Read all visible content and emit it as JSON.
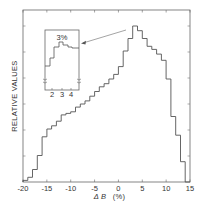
{
  "chart_data": {
    "type": "bar",
    "subtype": "step-histogram",
    "title": "",
    "xlabel": "Δ B    (%)",
    "xlabel_symbol": "Δ B",
    "xlabel_unit": "(%)",
    "ylabel": "RELATIVE VALUES",
    "xlim": [
      -20,
      15
    ],
    "ylim": [
      0,
      1.1
    ],
    "x_ticks": [
      -20,
      -15,
      -10,
      -5,
      0,
      5,
      10,
      15
    ],
    "x_tick_labels": [
      "-20",
      "-15",
      "-10",
      "-5",
      "0",
      "5",
      "10",
      "15"
    ],
    "y_tick_labels": [],
    "grid": false,
    "legend": null,
    "bin_edges": [
      -20,
      -19,
      -18,
      -17,
      -16,
      -15,
      -14,
      -13,
      -12,
      -11,
      -10,
      -9,
      -8,
      -7,
      -6,
      -5,
      -4,
      -3,
      -2,
      -1,
      0,
      1,
      2,
      3,
      4,
      5,
      6,
      7,
      8,
      9,
      10,
      11,
      12,
      13,
      14,
      15
    ],
    "values": [
      0.01,
      0.03,
      0.08,
      0.17,
      0.29,
      0.34,
      0.36,
      0.39,
      0.43,
      0.44,
      0.45,
      0.48,
      0.5,
      0.52,
      0.55,
      0.58,
      0.61,
      0.63,
      0.66,
      0.69,
      0.74,
      0.84,
      0.92,
      1.0,
      0.97,
      0.92,
      0.87,
      0.85,
      0.82,
      0.78,
      0.66,
      0.42,
      0.3,
      0.13,
      0.0
    ],
    "inset": {
      "description": "magnified view of peak region",
      "x_tick_labels": [
        "2",
        "3",
        "4"
      ],
      "annotation": "3%",
      "arrow_target": "histogram peak near ΔB = 3%",
      "axis_break_marks": true
    },
    "annotations": [
      {
        "text": "3%",
        "location": "inset peak"
      }
    ]
  }
}
